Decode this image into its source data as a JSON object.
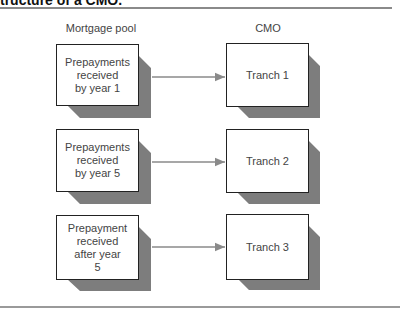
{
  "heading": "tructure of a CMO.",
  "columns": {
    "left": "Mortgage pool",
    "right": "CMO"
  },
  "rows": [
    {
      "source": "Prepayments\nreceived\nby year 1",
      "target": "Tranch 1"
    },
    {
      "source": "Prepayments\nreceived\nby year 5",
      "target": "Tranch 2"
    },
    {
      "source": "Prepayment\nreceived\nafter year\n5",
      "target": "Tranch 3"
    }
  ],
  "colors": {
    "shadow": "#7d7d7d",
    "arrow": "#8a8a8a",
    "border": "#222222"
  }
}
